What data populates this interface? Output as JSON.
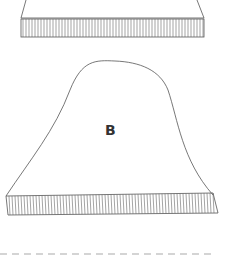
{
  "diagram": {
    "pieces": [
      {
        "id": "A",
        "label": "",
        "visible": "partial-top",
        "has_ribbing": true
      },
      {
        "id": "B",
        "label": "B",
        "has_ribbing": true
      }
    ],
    "stroke_color": "#555555",
    "dash_color": "#aaaaaa"
  }
}
